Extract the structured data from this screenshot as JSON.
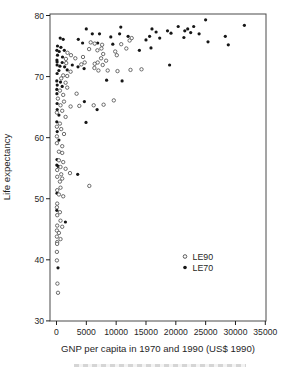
{
  "chart_data": {
    "type": "scatter",
    "title": "",
    "xlabel": "GNP per capita in 1970 and 1990 (US$ 1990)",
    "ylabel": "Life expectancy",
    "xlim": [
      0,
      35000
    ],
    "ylim": [
      30,
      80
    ],
    "grid": false,
    "x_ticks": [
      0,
      5000,
      10000,
      15000,
      20000,
      25000,
      30000,
      35000
    ],
    "x_tick_labels": [
      "0",
      "5000",
      "10000",
      "15000",
      "20000",
      "25000",
      "30000",
      "35000"
    ],
    "y_ticks": [
      30,
      40,
      50,
      60,
      70,
      80
    ],
    "y_tick_labels": [
      "30",
      "40",
      "50",
      "60",
      "70",
      "80"
    ],
    "legend": {
      "position": "inside-bottom-right",
      "entries": [
        "LE90",
        "LE70"
      ]
    },
    "series": [
      {
        "name": "LE70",
        "marker": "filled-circle",
        "fill": "#161616",
        "stroke": "#161616",
        "points": [
          [
            100,
            72.4
          ],
          [
            950,
            72.3
          ],
          [
            100,
            71.9
          ],
          [
            570,
            71.7
          ],
          [
            1350,
            71.6
          ],
          [
            2650,
            71.9
          ],
          [
            3600,
            71.6
          ],
          [
            4620,
            71.3
          ],
          [
            1800,
            71.1
          ],
          [
            400,
            71.0
          ],
          [
            100,
            70.5
          ],
          [
            50,
            69.3
          ],
          [
            670,
            69.1
          ],
          [
            120,
            68.6
          ],
          [
            960,
            68.4
          ],
          [
            50,
            67.9
          ],
          [
            60,
            67.2
          ],
          [
            100,
            65.6
          ],
          [
            120,
            64.6
          ],
          [
            400,
            63.7
          ],
          [
            50,
            62.6
          ],
          [
            120,
            61.0
          ],
          [
            400,
            59.6
          ],
          [
            80,
            56.4
          ],
          [
            50,
            55.5
          ],
          [
            300,
            55.3
          ],
          [
            80,
            50.9
          ],
          [
            50,
            48.1
          ],
          [
            1500,
            46.2
          ],
          [
            250,
            38.7
          ],
          [
            170,
            75.0
          ],
          [
            740,
            74.8
          ],
          [
            60,
            74.3
          ],
          [
            460,
            74.1
          ],
          [
            1300,
            74.3
          ],
          [
            170,
            73.5
          ],
          [
            1010,
            73.2
          ],
          [
            60,
            72.7
          ],
          [
            620,
            76.3
          ],
          [
            1130,
            76.1
          ],
          [
            3660,
            76.1
          ],
          [
            4380,
            75.5
          ],
          [
            5000,
            77.8
          ],
          [
            6000,
            77.0
          ],
          [
            7200,
            77.0
          ],
          [
            9100,
            76.5
          ],
          [
            10780,
            78.1
          ],
          [
            10570,
            77.0
          ],
          [
            12000,
            76.6
          ],
          [
            6900,
            75.5
          ],
          [
            9440,
            75.3
          ],
          [
            8400,
            69.4
          ],
          [
            4670,
            65.9
          ],
          [
            6800,
            64.6
          ],
          [
            4950,
            62.5
          ],
          [
            3550,
            54.0
          ],
          [
            11000,
            69.3
          ],
          [
            13900,
            74.3
          ],
          [
            15000,
            76.0
          ],
          [
            15600,
            76.6
          ],
          [
            16000,
            77.8
          ],
          [
            16700,
            77.3
          ],
          [
            17300,
            76.3
          ],
          [
            18600,
            77.5
          ],
          [
            19200,
            77.1
          ],
          [
            20400,
            78.2
          ],
          [
            21500,
            77.5
          ],
          [
            21350,
            76.4
          ],
          [
            15840,
            74.7
          ],
          [
            18950,
            71.9
          ],
          [
            25000,
            79.3
          ],
          [
            31500,
            78.4
          ],
          [
            23000,
            78.2
          ],
          [
            22000,
            77.8
          ],
          [
            22500,
            77.2
          ],
          [
            23900,
            77.0
          ],
          [
            28300,
            76.6
          ],
          [
            25400,
            75.7
          ],
          [
            28800,
            75.2
          ]
        ]
      },
      {
        "name": "LE90",
        "marker": "open-circle",
        "fill": "#ffffff",
        "stroke": "#4a4a4a",
        "points": [
          [
            1630,
            72.2
          ],
          [
            2360,
            70.8
          ],
          [
            1130,
            70.2
          ],
          [
            1800,
            70.1
          ],
          [
            790,
            69.7
          ],
          [
            1520,
            69.0
          ],
          [
            1800,
            68.2
          ],
          [
            570,
            67.7
          ],
          [
            1130,
            67.0
          ],
          [
            3370,
            67.2
          ],
          [
            240,
            66.4
          ],
          [
            1250,
            65.9
          ],
          [
            670,
            65.3
          ],
          [
            2360,
            65.1
          ],
          [
            960,
            64.4
          ],
          [
            60,
            64.1
          ],
          [
            1520,
            63.4
          ],
          [
            570,
            62.3
          ],
          [
            60,
            61.8
          ],
          [
            790,
            61.4
          ],
          [
            1250,
            60.6
          ],
          [
            60,
            60.2
          ],
          [
            60,
            59.1
          ],
          [
            960,
            58.6
          ],
          [
            400,
            57.7
          ],
          [
            960,
            57.5
          ],
          [
            400,
            56.3
          ],
          [
            1130,
            56.0
          ],
          [
            670,
            55.2
          ],
          [
            1520,
            54.9
          ],
          [
            120,
            54.7
          ],
          [
            2260,
            54.2
          ],
          [
            790,
            54.0
          ],
          [
            120,
            53.6
          ],
          [
            960,
            53.3
          ],
          [
            570,
            52.8
          ],
          [
            670,
            51.8
          ],
          [
            120,
            51.4
          ],
          [
            400,
            50.7
          ],
          [
            1130,
            50.4
          ],
          [
            120,
            49.2
          ],
          [
            60,
            48.6
          ],
          [
            570,
            47.8
          ],
          [
            120,
            47.3
          ],
          [
            670,
            46.4
          ],
          [
            120,
            45.6
          ],
          [
            960,
            45.4
          ],
          [
            60,
            44.8
          ],
          [
            400,
            44.4
          ],
          [
            60,
            43.8
          ],
          [
            670,
            43.4
          ],
          [
            120,
            42.9
          ],
          [
            100,
            42.6
          ],
          [
            60,
            41.3
          ],
          [
            60,
            39.9
          ],
          [
            150,
            36.1
          ],
          [
            250,
            34.6
          ],
          [
            1850,
            73.9
          ],
          [
            2430,
            73.5
          ],
          [
            1580,
            72.9
          ],
          [
            3150,
            73.0
          ],
          [
            5730,
            75.6
          ],
          [
            6400,
            75.4
          ],
          [
            5460,
            74.5
          ],
          [
            6860,
            74.3
          ],
          [
            7530,
            74.6
          ],
          [
            4450,
            73.2
          ],
          [
            7820,
            73.7
          ],
          [
            4720,
            72.3
          ],
          [
            4160,
            72.0
          ],
          [
            6400,
            72.1
          ],
          [
            10110,
            73.5
          ],
          [
            10850,
            75.3
          ],
          [
            7650,
            75.2
          ],
          [
            12600,
            76.3
          ],
          [
            12250,
            75.9
          ],
          [
            9840,
            74.1
          ],
          [
            11700,
            74.6
          ],
          [
            7480,
            73.0
          ],
          [
            8320,
            72.6
          ],
          [
            6910,
            72.3
          ],
          [
            7750,
            71.9
          ],
          [
            6350,
            71.4
          ],
          [
            7030,
            71.0
          ],
          [
            8590,
            71.0
          ],
          [
            9600,
            66.1
          ],
          [
            7900,
            65.4
          ],
          [
            6240,
            65.3
          ],
          [
            3830,
            65.2
          ],
          [
            14250,
            71.2
          ],
          [
            12400,
            71.1
          ],
          [
            10220,
            70.9
          ],
          [
            5500,
            52.1
          ]
        ]
      }
    ]
  }
}
